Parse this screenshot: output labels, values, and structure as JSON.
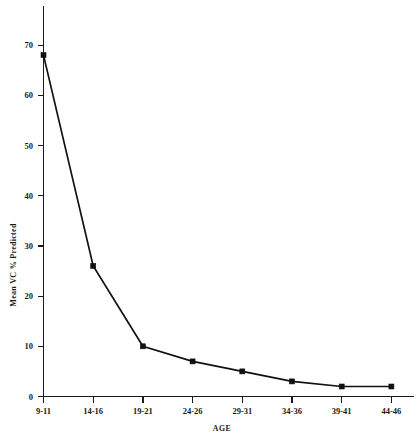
{
  "chart_data": {
    "type": "line",
    "title": "",
    "subtitle": "",
    "xlabel": "AGE",
    "ylabel": "Mean VC % Predicted",
    "categories": [
      "9-11",
      "14-16",
      "19-21",
      "24-26",
      "29-31",
      "34-36",
      "39-41",
      "44-46"
    ],
    "values": [
      68,
      26,
      10,
      7,
      5,
      3,
      2,
      2
    ],
    "series": [
      {
        "name": "Mean VC % Predicted",
        "values": [
          68,
          26,
          10,
          7,
          5,
          3,
          2,
          2
        ]
      }
    ],
    "yticks": [
      0,
      10,
      20,
      30,
      40,
      50,
      60,
      70
    ],
    "ytick_labels": [
      "0",
      "10",
      "20",
      "30",
      "40",
      "50",
      "60",
      "70"
    ],
    "xtick_labels": [
      "9-11",
      "14-16",
      "19-21",
      "24-26",
      "29-31",
      "34-36",
      "39-41",
      "44-46"
    ],
    "ylim": [
      0,
      73
    ],
    "xlim": [
      0,
      7
    ],
    "grid": false,
    "legend": false,
    "legend_position": "none",
    "marker": "filled-square",
    "line_color": "#111111",
    "axis_color": "#1a1a1a",
    "background_color": "#ffffff"
  },
  "axes": {
    "y_axis_title": "Mean VC % Predicted",
    "x_axis_title": "AGE"
  }
}
